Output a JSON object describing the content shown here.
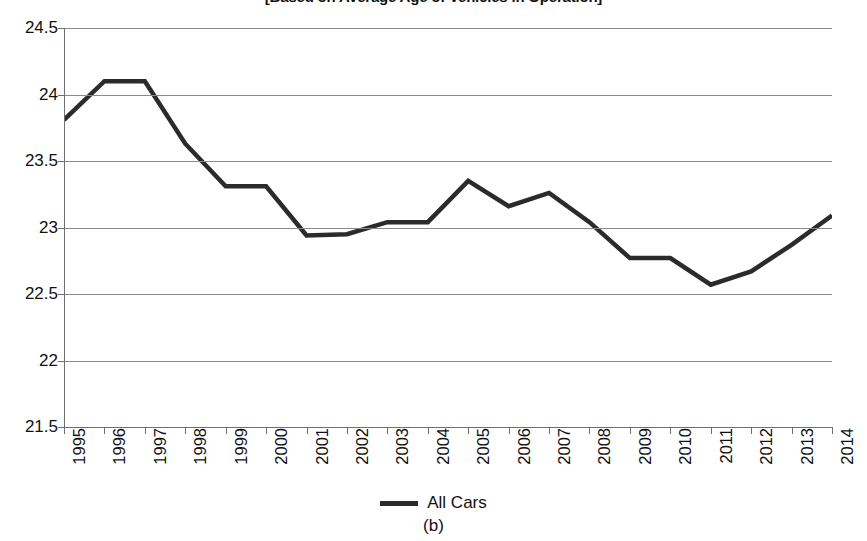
{
  "title": {
    "text": "[Based on Average Age of Vehicles in Operation]",
    "cropped": true
  },
  "caption": "(b)",
  "legend": {
    "position": "bottom",
    "entries": [
      {
        "label": "All Cars",
        "color": "#2b2b2b",
        "marker": "line-swatch"
      }
    ]
  },
  "axes": {
    "y_ticks": [
      "24.5",
      "24",
      "23.5",
      "23",
      "22.5",
      "22",
      "21.5"
    ],
    "x_ticks": [
      "1995",
      "1996",
      "1997",
      "1998",
      "1999",
      "2000",
      "2001",
      "2002",
      "2003",
      "2004",
      "2005",
      "2006",
      "2007",
      "2008",
      "2009",
      "2010",
      "2011",
      "2012",
      "2013",
      "2014"
    ]
  },
  "chart_data": {
    "type": "line",
    "title": "[Based on Average Age of Vehicles in Operation]",
    "xlabel": "",
    "ylabel": "",
    "ylim": [
      21.5,
      24.5
    ],
    "ytick_step": 0.5,
    "grid": true,
    "legend_position": "bottom",
    "categories": [
      "1995",
      "1996",
      "1997",
      "1998",
      "1999",
      "2000",
      "2001",
      "2002",
      "2003",
      "2004",
      "2005",
      "2006",
      "2007",
      "2008",
      "2009",
      "2010",
      "2011",
      "2012",
      "2013",
      "2014"
    ],
    "series": [
      {
        "name": "All Cars",
        "color": "#2b2b2b",
        "values": [
          23.81,
          24.1,
          24.1,
          23.63,
          23.31,
          23.31,
          22.94,
          22.95,
          23.04,
          23.04,
          23.35,
          23.16,
          23.26,
          23.04,
          22.77,
          22.77,
          22.57,
          22.67,
          22.87,
          23.09
        ]
      }
    ]
  }
}
